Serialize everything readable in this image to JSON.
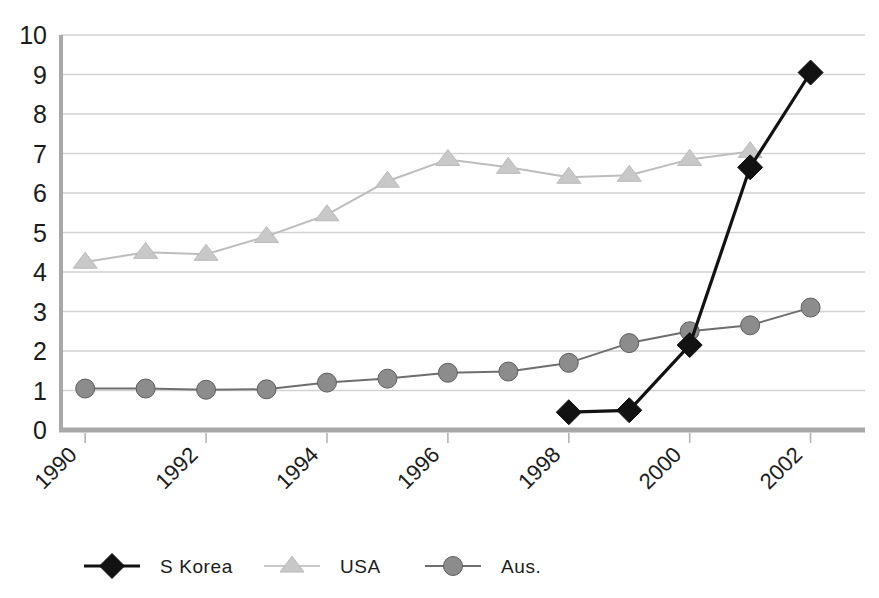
{
  "chart_data": {
    "type": "line",
    "title": "",
    "subtitle": "",
    "xlabel": "",
    "ylabel": "",
    "grid": true,
    "grid_axis": "y",
    "legend_position": "bottom",
    "xlim": [
      1989.6,
      2002.9
    ],
    "ylim": [
      0,
      10
    ],
    "yticks": [
      0,
      1,
      2,
      3,
      4,
      5,
      6,
      7,
      8,
      9,
      10
    ],
    "ytick_labels": [
      "0",
      "1",
      "2",
      "3",
      "4",
      "5",
      "6",
      "7",
      "8",
      "9",
      "10"
    ],
    "x": [
      1990,
      1991,
      1992,
      1993,
      1994,
      1995,
      1996,
      1997,
      1998,
      1999,
      2000,
      2001,
      2002
    ],
    "xticks": [
      1990,
      1992,
      1994,
      1996,
      1998,
      2000,
      2002
    ],
    "xtick_labels": [
      "1990",
      "1992",
      "1994",
      "1996",
      "1998",
      "2000",
      "2002"
    ],
    "xtick_rotation": 45,
    "series": [
      {
        "name": "S Korea",
        "marker": "diamond",
        "color": "#121212",
        "line_color": "#121212",
        "x": [
          1998,
          1999,
          2000,
          2001,
          2002
        ],
        "values": [
          0.45,
          0.5,
          2.15,
          6.65,
          9.05
        ]
      },
      {
        "name": "USA",
        "marker": "triangle",
        "color": "#c8c8c8",
        "line_color": "#bdbdbd",
        "x": [
          1990,
          1991,
          1992,
          1993,
          1994,
          1995,
          1996,
          1997,
          1998,
          1999,
          2000,
          2001
        ],
        "values": [
          4.25,
          4.5,
          4.45,
          4.9,
          5.45,
          6.3,
          6.85,
          6.65,
          6.4,
          6.45,
          6.85,
          7.05
        ]
      },
      {
        "name": "Aus.",
        "marker": "circle",
        "color": "#8c8c8c",
        "line_color": "#6e6e6e",
        "x": [
          1990,
          1991,
          1992,
          1993,
          1994,
          1995,
          1996,
          1997,
          1998,
          1999,
          2000,
          2001,
          2002
        ],
        "values": [
          1.05,
          1.05,
          1.02,
          1.03,
          1.2,
          1.3,
          1.45,
          1.48,
          1.7,
          2.2,
          2.5,
          2.65,
          3.1
        ]
      }
    ]
  },
  "legend": {
    "items": [
      {
        "label": "S Korea",
        "marker": "diamond-icon",
        "color": "#121212"
      },
      {
        "label": "USA",
        "marker": "triangle-icon",
        "color": "#c8c8c8"
      },
      {
        "label": "Aus.",
        "marker": "circle-icon",
        "color": "#8c8c8c"
      }
    ]
  },
  "axes": {
    "y_axis_name": "value-axis",
    "x_axis_name": "year-axis"
  }
}
